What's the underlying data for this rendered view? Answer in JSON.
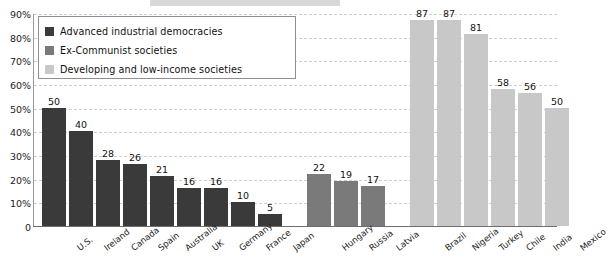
{
  "title_strip": {
    "text": ""
  },
  "legend": {
    "position": "upper-left-inset",
    "items": [
      {
        "label": "Advanced industrial democracies",
        "color": "#3a3a3a"
      },
      {
        "label": "Ex-Communist societies",
        "color": "#7a7a7a"
      },
      {
        "label": "Developing and low-income societies",
        "color": "#c8c8c8"
      }
    ]
  },
  "chart_data": {
    "type": "bar",
    "title": "",
    "xlabel": "",
    "ylabel": "",
    "ylim": [
      0,
      90
    ],
    "grid": true,
    "ytick_labels": [
      "90%",
      "80%",
      "70%",
      "60%",
      "50%",
      "40%",
      "30%",
      "20%",
      "10%",
      "0"
    ],
    "ytick_values": [
      90,
      80,
      70,
      60,
      50,
      40,
      30,
      20,
      10,
      0
    ],
    "legend_position": "upper left",
    "groups": [
      {
        "name": "Advanced industrial democracies",
        "color": "#3a3a3a",
        "categories": [
          "U.S.",
          "Ireland",
          "Canada",
          "Spain",
          "Australia",
          "UK",
          "Germany",
          "France",
          "Japan"
        ],
        "values": [
          50,
          40,
          28,
          26,
          21,
          16,
          16,
          10,
          5
        ]
      },
      {
        "name": "Ex-Communist societies",
        "color": "#7a7a7a",
        "categories": [
          "Hungary",
          "Russia",
          "Latvia"
        ],
        "values": [
          22,
          19,
          17
        ]
      },
      {
        "name": "Developing and low-income societies",
        "color": "#c8c8c8",
        "categories": [
          "Brazil",
          "Nigeria",
          "Turkey",
          "Chile",
          "India",
          "Mexico"
        ],
        "values": [
          87,
          87,
          81,
          58,
          56,
          50
        ]
      }
    ]
  }
}
